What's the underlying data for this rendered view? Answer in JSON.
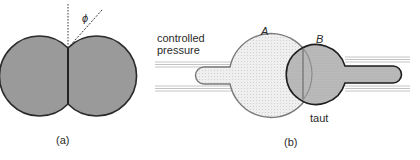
{
  "panel_a": {
    "caption": "(a)",
    "angle_label": "ϕ",
    "fill_color": "#9a9a9a",
    "stroke_color": "#2a2a2a"
  },
  "panel_b": {
    "caption": "(b)",
    "input_label_line1": "controlled",
    "input_label_line2": "pressure",
    "bubble_a_label": "A",
    "bubble_b_label": "B",
    "taut_label": "taut",
    "bubble_a_fill": "#ececec",
    "bubble_a_stroke": "#7a7a7a",
    "bubble_b_fill": "#bdbdbd",
    "bubble_b_stroke": "#1e1e1e",
    "pipette_line_color": "#b5b5b5"
  }
}
